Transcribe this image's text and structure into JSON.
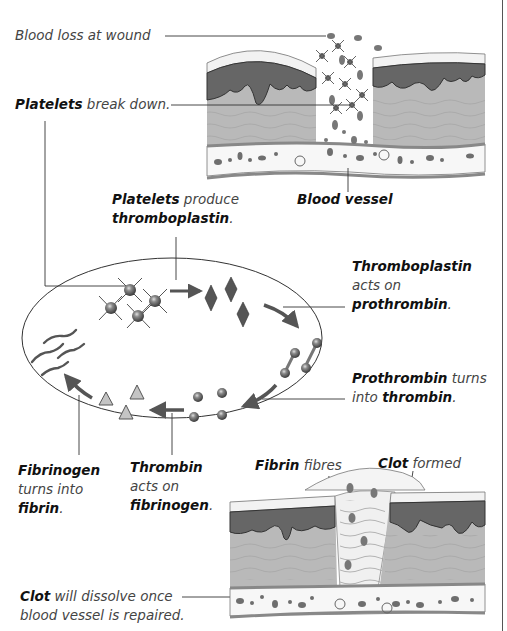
{
  "diagram": {
    "labels": {
      "blood_loss": "Blood loss at wound",
      "platelets_break_bold": "Platelets",
      "platelets_break_rest": " break down.",
      "blood_vessel": "Blood vessel",
      "platelets_produce_bold": "Platelets",
      "platelets_produce_rest": " produce",
      "thromboplastin_bold": "thromboplastin",
      "thromboplastin_dot": ".",
      "thrombo_acts_bold": "Thromboplastin",
      "thrombo_acts_line2": "acts on",
      "thrombo_acts_line3_bold": "prothrombin",
      "thrombo_acts_line3_dot": ".",
      "prothrombin_bold": "Prothrombin",
      "prothrombin_rest": " turns",
      "prothrombin_line2": "into ",
      "prothrombin_line2_bold": "thrombin",
      "prothrombin_line2_dot": ".",
      "fibrinogen_bold": "Fibrinogen",
      "fibrinogen_line2": "turns into",
      "fibrinogen_line3_bold": "fibrin",
      "fibrinogen_line3_dot": ".",
      "thrombin_bold": "Thrombin",
      "thrombin_line2": "acts on",
      "thrombin_line3_bold": "fibrinogen",
      "thrombin_line3_dot": ".",
      "fibrin_bold": "Fibrin",
      "fibrin_rest": " fibres",
      "clot_formed_bold": "Clot",
      "clot_formed_rest": " formed",
      "clot_dissolve_bold": "Clot",
      "clot_dissolve_rest": " will dissolve once",
      "clot_dissolve_line2": "blood vessel is repaired."
    },
    "cycle_stages": [
      "platelets",
      "thromboplastin",
      "prothrombin",
      "thrombin",
      "fibrinogen",
      "fibrin"
    ],
    "colors": {
      "epidermis": "#6a6a6a",
      "dermis": "#b4b4b4",
      "vessel_wall": "#8c8c8c",
      "cell": "#707070",
      "outline": "#333333"
    }
  }
}
